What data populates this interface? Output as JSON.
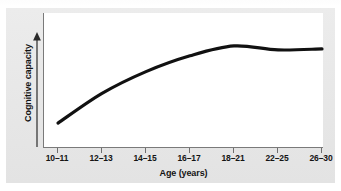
{
  "figure": {
    "background_color": "#ffffff",
    "panel_color": "#e9e9e9",
    "plot_background": "#ffffff",
    "axis_color": "#7a7a7a",
    "curve_color": "#111111",
    "text_color": "#141414",
    "scan_remnant_text": "· · ·"
  },
  "chart_data": {
    "type": "line",
    "title": "",
    "subtitle": "",
    "xlabel": "Age (years)",
    "ylabel": "Cognitive capacity",
    "categories": [
      "10–11",
      "12–13",
      "14–15",
      "16–17",
      "18–21",
      "22–25",
      "26–30"
    ],
    "series": [
      {
        "name": "Cognitive capacity",
        "values": [
          12,
          42,
          64,
          80,
          90,
          86,
          87
        ]
      }
    ],
    "x_tick_labels": [
      "10–11",
      "12–13",
      "14–15",
      "16–17",
      "18–21",
      "22–25",
      "26–30"
    ],
    "y_tick_labels": [],
    "ylim": [
      0,
      100
    ],
    "y_axis_has_scale": false,
    "y_axis_arrow": "up",
    "grid": false,
    "legend": false,
    "legend_position": "none",
    "annotations": []
  },
  "axes": {
    "x_axis_title": "Age (years)",
    "y_axis_title": "Cognitive capacity"
  }
}
